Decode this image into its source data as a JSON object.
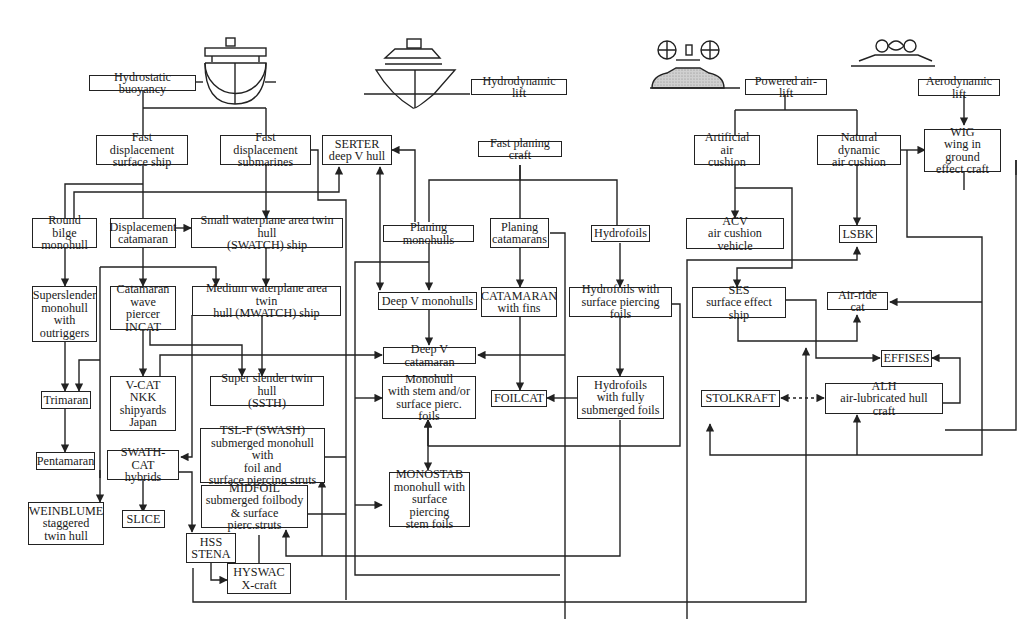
{
  "diagram": {
    "categories": {
      "hydrostatic": "Hydrostatic buoyancy",
      "hydrodynamic": "Hydrodynamic lift",
      "powered_air": "Powered air-lift",
      "aerodynamic": "Aerodynamic lift"
    },
    "nodes": {
      "fd_surface": "Fast displacement\nsurface ship",
      "fd_sub": "Fast displacement\nsubmarines",
      "serter": "SERTER\ndeep V hull",
      "fast_planing": "Fast planing craft",
      "artificial_air": "Artificial air\ncushion",
      "natural_air": "Natural dynamic\nair cushion",
      "wig": "WIG\nwing in ground\neffect craft",
      "round_bilge": "Round bilge\nmonohull",
      "disp_cat": "Displacement\ncatamaran",
      "swatch": "Small waterplane area twin hull\n(SWATCH) ship",
      "planing_mono": "Planing monohulls",
      "planing_cat": "Planing\ncatamarans",
      "hydrofoils": "Hydrofoils",
      "acv": "ACV\nair cushion vehicle",
      "lsbk": "LSBK",
      "superslender": "Superslender\nmonohull\nwith\noutriggers",
      "cat_wave": "Catamaran\nwave piercer\nINCAT",
      "mwatch": "Medium waterplane area twin\nhull (MWATCH) ship",
      "deepv_mono": "Deep V monohulls",
      "cat_fins": "CATAMARAN\nwith fins",
      "hf_surface": "Hydrofoils with\nsurface piercing foils",
      "ses": "SES\nsurface effect ship",
      "air_ride": "Air-ride cat",
      "deepv_cat": "Deep V catamaran",
      "effises": "EFFISES",
      "trimaran": "Trimaran",
      "vcat": "V-CAT\nNKK\nshipyards\nJapan",
      "ssth": "Super slender twin hull\n(SSTH)",
      "mono_stem": "Monohull\nwith stem and/or\nsurface pierc. foils",
      "foilcat": "FOILCAT",
      "hf_submerged": "Hydrofoils\nwith fully\nsubmerged foils",
      "stolkraft": "STOLKRAFT",
      "alh": "ALH\nair-lubricated hull craft",
      "pentamaran": "Pentamaran",
      "swath_cat": "SWATH-CAT\nhybrids",
      "tslf": "TSL-F (SWASH)\nsubmerged monohull with\nfoil and\nsurface piercing struts",
      "weinblume": "WEINBLUME\nstaggered\ntwin hull",
      "slice": "SLICE",
      "midfoil": "MIDFOIL\nsubmerged foilbody\n& surface pierc.struts",
      "monostab": "MONOSTAB\nmonohull with\nsurface piercing\nstem foils",
      "hss": "HSS\nSTENA",
      "hyswac": "HYSWAC\nX-craft"
    },
    "icons": {
      "displacement_hull": "displacement-hull-icon",
      "planing_hull": "planing-hull-icon",
      "hovercraft": "hovercraft-icon",
      "wig_craft": "wig-craft-icon"
    },
    "colors": {
      "line": "#222222",
      "background": "#ffffff",
      "hatch": "#bdbdbd"
    }
  }
}
